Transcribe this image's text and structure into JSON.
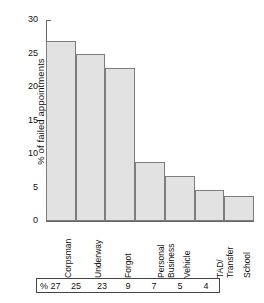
{
  "chart_data": {
    "type": "bar",
    "title": "",
    "xlabel": "",
    "ylabel": "% of failed appointments",
    "ylim": [
      0,
      30
    ],
    "yticks": [
      0,
      5,
      10,
      15,
      20,
      25,
      30
    ],
    "grid": false,
    "legend": "none",
    "categories": [
      "Corpsman",
      "Underway",
      "Forgot",
      "Personal\nBusiness",
      "Vehicle",
      "TAD/\nTransfer",
      "School"
    ],
    "values": [
      27,
      25,
      23,
      9,
      7,
      5,
      4
    ],
    "bar_heights_pct": [
      26.9,
      24.9,
      22.8,
      8.8,
      6.7,
      4.7,
      3.7
    ],
    "table": {
      "row_prefix": "%",
      "cells": [
        "27",
        "25",
        "23",
        "9",
        "7",
        "5",
        "4"
      ]
    },
    "colors": {
      "bar_fill": "#e2e2e2",
      "bar_edge": "#7d7d7d",
      "axis": "#666666",
      "text": "#111111",
      "background": "#ffffff"
    }
  }
}
